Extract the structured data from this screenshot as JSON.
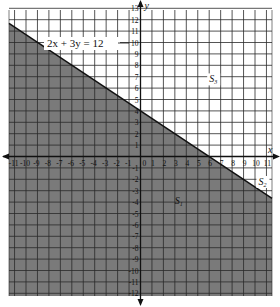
{
  "figure": {
    "equation_label": "2x + 3y = 12",
    "region_labels": [
      {
        "id": "S1",
        "text": "S",
        "sub": "1",
        "x": 3.0,
        "y": -4.2
      },
      {
        "id": "S2",
        "text": "S",
        "sub": "2",
        "x": 10.3,
        "y": -2.5
      },
      {
        "id": "S3",
        "text": "S",
        "sub": "3",
        "x": 6.0,
        "y": 6.5
      }
    ],
    "axes": {
      "x_label": "x",
      "y_label": "y",
      "x_ticks": [
        "-11",
        "-10",
        "-9",
        "-8",
        "-7",
        "-6",
        "-5",
        "-4",
        "-3",
        "-2",
        "-1",
        "0",
        "1",
        "2",
        "3",
        "4",
        "5",
        "6",
        "7",
        "8",
        "9",
        "10",
        "11"
      ],
      "y_ticks": [
        "13",
        "12",
        "11",
        "10",
        "9",
        "8",
        "7",
        "6",
        "5",
        "4",
        "3",
        "2",
        "1",
        "-1",
        "-2",
        "-3",
        "-4",
        "-5",
        "-6",
        "-7",
        "-8",
        "-9",
        "-10",
        "-11",
        "-12"
      ]
    },
    "colors": {
      "shade": "#7a7a7a",
      "grid": "#2a2a2a",
      "background": "#ffffff",
      "line": "#111111"
    }
  },
  "chart_data": {
    "type": "area",
    "title": "",
    "xlabel": "x",
    "ylabel": "y",
    "xlim": [
      -11.5,
      11.5
    ],
    "ylim": [
      -12.5,
      13.3
    ],
    "grid": true,
    "line": {
      "equation": "2x + 3y = 12",
      "slope": -0.6667,
      "intercept": 4,
      "x": [
        -11.5,
        11.5
      ],
      "y": [
        11.67,
        -3.67
      ]
    },
    "shaded_region": "2x + 3y <= 12 (below the line)",
    "regions": [
      "S1 (shaded, below line)",
      "S2 (on the line)",
      "S3 (unshaded, above line)"
    ],
    "x_ticks": [
      -11,
      -10,
      -9,
      -8,
      -7,
      -6,
      -5,
      -4,
      -3,
      -2,
      -1,
      0,
      1,
      2,
      3,
      4,
      5,
      6,
      7,
      8,
      9,
      10,
      11
    ],
    "y_ticks": [
      -12,
      -11,
      -10,
      -9,
      -8,
      -7,
      -6,
      -5,
      -4,
      -3,
      -2,
      -1,
      1,
      2,
      3,
      4,
      5,
      6,
      7,
      8,
      9,
      10,
      11,
      12,
      13
    ]
  }
}
